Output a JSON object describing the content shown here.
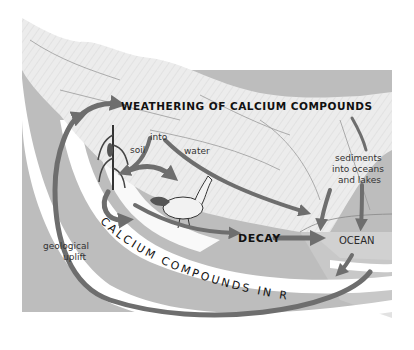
{
  "diagram": {
    "labels": {
      "weathering": "WEATHERING OF CALCIUM COMPOUNDS",
      "into": "into",
      "soil": "soil",
      "water": "water",
      "sediments_line1": "sediments",
      "sediments_line2": "into oceans",
      "sediments_line3": "and lakes",
      "decay": "DECAY",
      "ocean": "OCEAN",
      "geological_line1": "geological",
      "geological_line2": "uplift",
      "rocks": "CALCIUM COMPOUNDS IN ROCKS"
    },
    "nodes": [
      {
        "id": "weathering",
        "label": "WEATHERING OF CALCIUM COMPOUNDS"
      },
      {
        "id": "soil",
        "label": "into soil"
      },
      {
        "id": "water",
        "label": "water"
      },
      {
        "id": "plants",
        "label": "corn plant"
      },
      {
        "id": "animals",
        "label": "chicken"
      },
      {
        "id": "decay",
        "label": "DECAY"
      },
      {
        "id": "ocean",
        "label": "OCEAN"
      },
      {
        "id": "sediments",
        "label": "sediments into oceans and lakes"
      },
      {
        "id": "rocks",
        "label": "CALCIUM COMPOUNDS IN ROCKS"
      }
    ],
    "edges": [
      {
        "from": "weathering",
        "to": "soil"
      },
      {
        "from": "weathering",
        "to": "water"
      },
      {
        "from": "weathering",
        "to": "sediments"
      },
      {
        "from": "soil",
        "to": "plants"
      },
      {
        "from": "plants",
        "to": "animals"
      },
      {
        "from": "plants",
        "to": "decay"
      },
      {
        "from": "animals",
        "to": "decay"
      },
      {
        "from": "water",
        "to": "ocean"
      },
      {
        "from": "decay",
        "to": "ocean"
      },
      {
        "from": "sediments",
        "to": "ocean"
      },
      {
        "from": "ocean",
        "to": "rocks"
      },
      {
        "from": "rocks",
        "to": "weathering",
        "label": "geological uplift"
      }
    ],
    "colors": {
      "arrow": "#6e6e6e",
      "ground": "#bdbdbd",
      "ground_light": "#d2d2d2",
      "band": "#ffffff",
      "mountain": "#ececec",
      "text": "#111111"
    }
  }
}
